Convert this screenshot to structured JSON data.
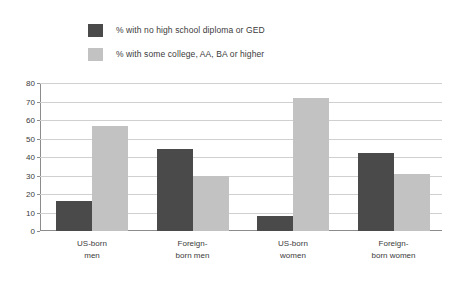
{
  "legend": {
    "items": [
      {
        "label": "% with no high school diploma or GED",
        "color": "#4a4a4a",
        "swatch_name": "legend-swatch-no-diploma"
      },
      {
        "label": "% with some college, AA, BA or higher",
        "color": "#c2c2c2",
        "swatch_name": "legend-swatch-some-college"
      }
    ]
  },
  "axis": {
    "y_ticks": [
      "0",
      "10",
      "20",
      "30",
      "40",
      "50",
      "60",
      "70",
      "80"
    ]
  },
  "chart_data": {
    "type": "bar",
    "title": "",
    "xlabel": "",
    "ylabel": "",
    "ylim": [
      0,
      80
    ],
    "ytick_step": 10,
    "grid": true,
    "legend_position": "top-left",
    "categories": [
      "US-born\nmen",
      "Foreign-\nborn men",
      "US-born\nwomen",
      "Foreign-\nborn women"
    ],
    "series": [
      {
        "name": "% with no high school diploma or GED",
        "color": "#4a4a4a",
        "values": [
          16,
          44.5,
          8,
          42
        ]
      },
      {
        "name": "% with some college, AA, BA or higher",
        "color": "#c2c2c2",
        "values": [
          57,
          29.5,
          72,
          31
        ]
      }
    ]
  }
}
